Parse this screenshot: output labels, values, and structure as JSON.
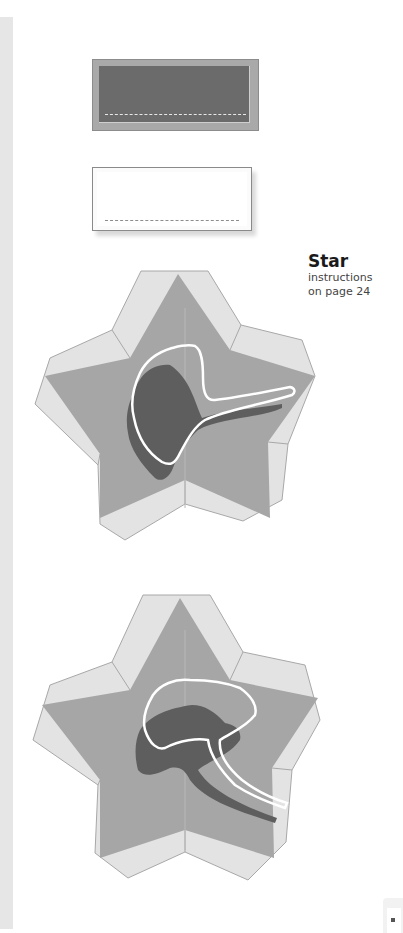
{
  "page": {
    "section_caption": {
      "title": "Star",
      "lines": [
        "instructions",
        "on page 24"
      ]
    },
    "templates": [
      {
        "name": "dark label card",
        "fill": "#6b6b6b",
        "frame": "#a9a9a9"
      },
      {
        "name": "light label card",
        "fill": "#ffffff",
        "frame": "#8a8a8a"
      },
      {
        "name": "star box with ginkgo leaf (stem right)",
        "outer_tab": "#e3e3e3",
        "inner_star": "#a6a6a6",
        "leaf_shadow": "#5e5e5e",
        "outline": "#ffffff"
      },
      {
        "name": "star box with ginkgo leaf (stem lower right)",
        "outer_tab": "#e3e3e3",
        "inner_star": "#a6a6a6",
        "leaf_shadow": "#5e5e5e",
        "outline": "#ffffff"
      }
    ]
  }
}
